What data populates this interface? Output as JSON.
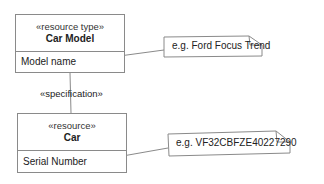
{
  "diagram": {
    "classes": [
      {
        "stereotype": "«resource type»",
        "name": "Car Model",
        "attribute": "Model name"
      },
      {
        "stereotype": "«resource»",
        "name": "Car",
        "attribute": "Serial Number"
      }
    ],
    "association": {
      "label": "«specification»"
    },
    "notes": [
      {
        "text": "e.g. Ford Focus Trend"
      },
      {
        "text": "e.g. VF32CBFZE40227290"
      }
    ],
    "colors": {
      "line": "#8a8a8a",
      "text": "#222222",
      "background": "#ffffff"
    }
  }
}
